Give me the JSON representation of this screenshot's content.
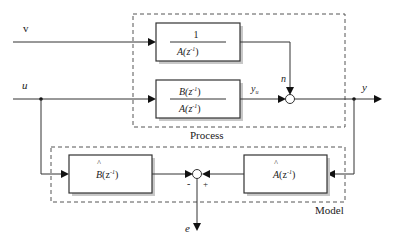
{
  "diagram": {
    "groups": {
      "process": {
        "label": "Process"
      },
      "model": {
        "label": "Model"
      }
    },
    "inputs": {
      "v": "v",
      "u": "u"
    },
    "blocks": {
      "noise_filter": {
        "numerator": "1",
        "denominator": "A(z",
        "exp": "-1",
        "close": ")"
      },
      "plant": {
        "numerator": "B(z",
        "denominator": "A(z",
        "exp": "-1",
        "close": ")"
      },
      "b_hat": {
        "hat": "^",
        "base": "B",
        "arg": "(z",
        "exp": "-1",
        "close": ")"
      },
      "a_hat": {
        "hat": "^",
        "base": "A",
        "arg": "(z",
        "exp": "-1",
        "close": ")"
      }
    },
    "signals": {
      "n": "n",
      "y_u": "y",
      "y_u_sub": "u",
      "y": "y",
      "e": "e"
    },
    "signs": {
      "minus": "-",
      "plus": "+"
    }
  }
}
